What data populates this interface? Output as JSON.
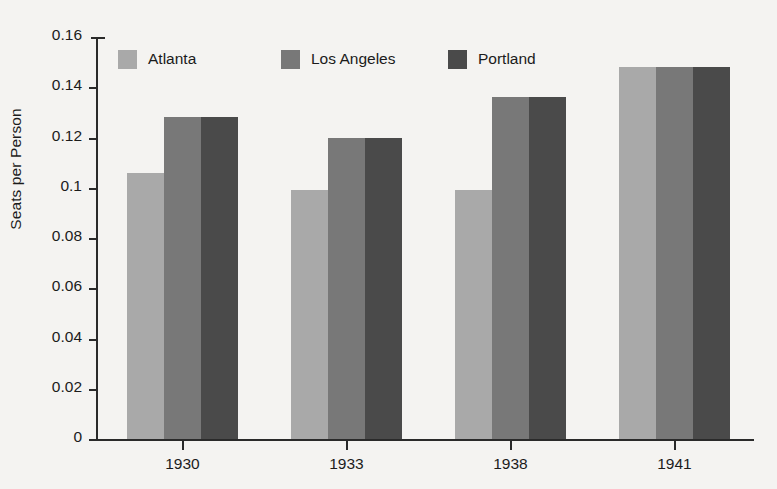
{
  "chart_data": {
    "type": "bar",
    "title": "",
    "subtitle": "",
    "xlabel": "",
    "ylabel": "Seats per Person",
    "categories": [
      "1930",
      "1933",
      "1938",
      "1941"
    ],
    "series": [
      {
        "name": "Atlanta",
        "color": "#a9a9a9",
        "values": [
          0.106,
          0.099,
          0.099,
          0.148
        ]
      },
      {
        "name": "Los Angeles",
        "color": "#787878",
        "values": [
          0.128,
          0.12,
          0.136,
          0.148
        ]
      },
      {
        "name": "Portland",
        "color": "#4a4a4a",
        "values": [
          0.128,
          0.12,
          0.136,
          0.148
        ]
      }
    ],
    "ylim": [
      0,
      0.16
    ],
    "ytick_values": [
      0,
      0.02,
      0.04,
      0.06,
      0.08,
      0.1,
      0.12,
      0.14,
      0.16
    ],
    "ytick_labels": [
      "0",
      "0.02",
      "0.04",
      "0.06",
      "0.08",
      "0.1",
      "0.12",
      "0.14",
      "0.16"
    ],
    "grid": false,
    "legend_position": "top-left-inside",
    "background_color": "#f4f3f1",
    "axis_color": "#2a2a2a",
    "text_color": "#1b1b1b"
  }
}
